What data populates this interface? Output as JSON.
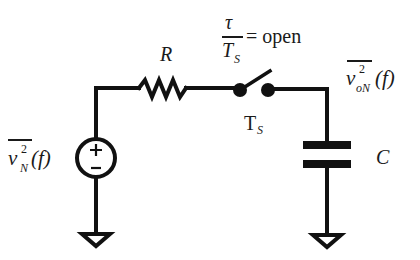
{
  "diagram": {
    "type": "circuit-schematic",
    "stroke_color": "#111111",
    "background": "#ffffff",
    "components": {
      "resistor": {
        "label": "R"
      },
      "capacitor": {
        "label": "C"
      },
      "source": {
        "label_base": "v",
        "label_sup": "2",
        "label_sub": "N",
        "label_arg": "(f)",
        "plus": "+",
        "minus": "−"
      },
      "switch": {
        "condition_numerator": "τ",
        "condition_denominator_base": "T",
        "condition_denominator_sub": "S",
        "condition_text": "= open",
        "period_base": "T",
        "period_sub": "S"
      },
      "output": {
        "label_base": "v",
        "label_sup": "2",
        "label_sub": "oN",
        "label_arg": "(f)"
      }
    }
  }
}
